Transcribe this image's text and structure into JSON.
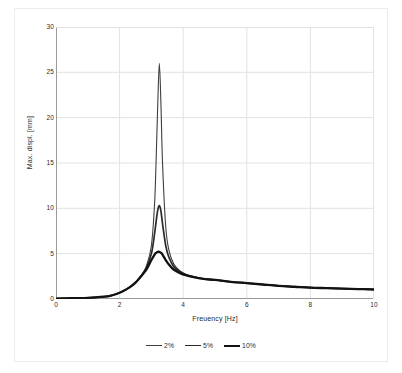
{
  "chart_data": {
    "type": "line",
    "title": "",
    "xlabel": "Freuency [Hz]",
    "ylabel": "Max. displ. [mm]",
    "xlim": [
      0,
      10
    ],
    "ylim": [
      0,
      30
    ],
    "xticks": [
      0,
      2,
      4,
      6,
      8,
      10
    ],
    "yticks": [
      0,
      5,
      10,
      15,
      20,
      25,
      30
    ],
    "grid": true,
    "legend_position": "bottom-center",
    "peak_frequency_hz": 3.25,
    "x": [
      0,
      0.25,
      0.5,
      0.75,
      1,
      1.25,
      1.5,
      1.7,
      1.9,
      2.1,
      2.3,
      2.5,
      2.7,
      2.85,
      3,
      3.1,
      3.15,
      3.2,
      3.25,
      3.3,
      3.35,
      3.45,
      3.55,
      3.7,
      3.9,
      4.1,
      4.4,
      4.7,
      5,
      5.5,
      6,
      6.5,
      7,
      7.5,
      8,
      8.5,
      9,
      9.5,
      10
    ],
    "series": [
      {
        "name": "2%",
        "color": "#3f3f3f",
        "peak_value": 26.0,
        "values": [
          0.05,
          0.06,
          0.08,
          0.1,
          0.13,
          0.18,
          0.25,
          0.35,
          0.55,
          0.85,
          1.25,
          1.8,
          2.7,
          3.7,
          5.9,
          10.5,
          15.5,
          21.5,
          26.0,
          21.5,
          15.0,
          8.0,
          5.4,
          3.9,
          3.1,
          2.7,
          2.4,
          2.2,
          2.1,
          1.9,
          1.75,
          1.6,
          1.45,
          1.35,
          1.25,
          1.2,
          1.15,
          1.1,
          1.05
        ]
      },
      {
        "name": "5%",
        "color": "#2a2a2a",
        "peak_value": 10.3,
        "values": [
          0.05,
          0.06,
          0.08,
          0.1,
          0.13,
          0.18,
          0.25,
          0.35,
          0.55,
          0.85,
          1.25,
          1.8,
          2.65,
          3.5,
          5.0,
          7.2,
          8.6,
          9.8,
          10.3,
          9.7,
          8.3,
          5.9,
          4.6,
          3.6,
          3.0,
          2.65,
          2.4,
          2.2,
          2.1,
          1.9,
          1.75,
          1.6,
          1.45,
          1.35,
          1.25,
          1.2,
          1.15,
          1.1,
          1.05
        ]
      },
      {
        "name": "10%",
        "color": "#121212",
        "peak_value": 5.2,
        "values": [
          0.05,
          0.06,
          0.08,
          0.1,
          0.13,
          0.18,
          0.25,
          0.35,
          0.55,
          0.85,
          1.25,
          1.8,
          2.6,
          3.3,
          4.3,
          4.9,
          5.1,
          5.2,
          5.2,
          5.1,
          4.9,
          4.3,
          3.8,
          3.25,
          2.85,
          2.6,
          2.35,
          2.2,
          2.1,
          1.9,
          1.75,
          1.6,
          1.45,
          1.35,
          1.25,
          1.2,
          1.15,
          1.1,
          1.05
        ]
      }
    ],
    "legend": [
      {
        "label": "2%",
        "color": "#3f3f3f",
        "line_width": 1.1
      },
      {
        "label": "5%",
        "color": "#2a2a2a",
        "line_width": 1.6
      },
      {
        "label": "10%",
        "color": "#121212",
        "line_width": 2.1
      }
    ],
    "colors": {
      "grid": "#e2e2e2",
      "axis": "#9a9a9a",
      "text": "#2b2b2b",
      "background": "#ffffff",
      "frame": "#ececec"
    }
  }
}
